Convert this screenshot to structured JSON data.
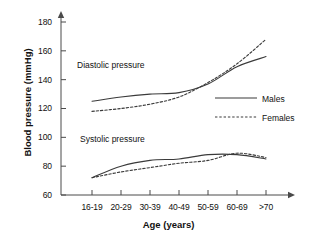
{
  "chart_data": {
    "type": "line",
    "title": "",
    "xlabel": "Age (years)",
    "ylabel": "Blood pressure (mmHg)",
    "categories": [
      "16-19",
      "20-29",
      "30-39",
      "40-49",
      "50-59",
      "60-69",
      ">70"
    ],
    "ylim": [
      60,
      180
    ],
    "yticks": [
      60,
      80,
      100,
      120,
      140,
      160,
      180
    ],
    "grid": false,
    "legend_position": "right-middle",
    "legend": [
      "Males",
      "Females"
    ],
    "annotations": [
      "Diastolic pressure",
      "Systolic pressure"
    ],
    "series": [
      {
        "name": "Males",
        "group": "Diastolic pressure",
        "style": "solid",
        "color": "#3a3a3a",
        "values": [
          125,
          128,
          130,
          131,
          137,
          149,
          156
        ]
      },
      {
        "name": "Females",
        "group": "Diastolic pressure",
        "style": "dashed",
        "color": "#3a3a3a",
        "values": [
          118,
          120,
          123,
          128,
          138,
          151,
          168
        ]
      },
      {
        "name": "Males",
        "group": "Systolic pressure",
        "style": "solid",
        "color": "#3a3a3a",
        "values": [
          72,
          80,
          84,
          85,
          88,
          88,
          85
        ]
      },
      {
        "name": "Females",
        "group": "Systolic pressure",
        "style": "dashed",
        "color": "#3a3a3a",
        "values": [
          72,
          76,
          79,
          82,
          84,
          89,
          86
        ]
      }
    ]
  },
  "axes": {
    "y_title": "Blood pressure (mmHg)",
    "x_title": "Age (years)",
    "y_ticks": [
      "180",
      "160",
      "140",
      "120",
      "100",
      "80",
      "60"
    ],
    "x_ticks": [
      "16-19",
      "20-29",
      "30-39",
      "40-49",
      "50-59",
      "60-69",
      ">70"
    ]
  },
  "annotations": {
    "diastolic": "Diastolic pressure",
    "systolic": "Systolic pressure"
  },
  "legend": {
    "males": "Males",
    "females": "Females"
  }
}
